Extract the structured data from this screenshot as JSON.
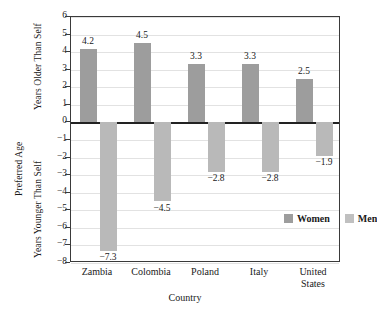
{
  "chart_data": {
    "type": "bar",
    "title": "",
    "xlabel": "Country",
    "ylabel": "Preferred Age",
    "ylabel_upper": "Years Older Than Self",
    "ylabel_lower": "Years Younger Than Self",
    "categories": [
      "Zambia",
      "Colombia",
      "Poland",
      "Italy",
      "United States"
    ],
    "category_lines": [
      [
        "Zambia"
      ],
      [
        "Colombia"
      ],
      [
        "Poland"
      ],
      [
        "Italy"
      ],
      [
        "United",
        "States"
      ]
    ],
    "series": [
      {
        "name": "Women",
        "color": "#9d9d9d",
        "values": [
          4.2,
          4.5,
          3.3,
          3.3,
          2.5
        ],
        "labels": [
          "4.2",
          "4.5",
          "3.3",
          "3.3",
          "2.5"
        ]
      },
      {
        "name": "Men",
        "color": "#b9b9b9",
        "values": [
          -7.3,
          -4.5,
          -2.8,
          -2.8,
          -1.9
        ],
        "labels": [
          "−7.3",
          "−4.5",
          "−2.8",
          "−2.8",
          "−1.9"
        ]
      }
    ],
    "ylim": [
      -8,
      6
    ],
    "yticks": [
      6,
      5,
      4,
      3,
      2,
      1,
      0,
      -1,
      -2,
      -3,
      -4,
      -5,
      -6,
      -7,
      -8
    ],
    "ytick_labels": [
      "6",
      "5",
      "4",
      "3",
      "2",
      "1",
      "0",
      "−1",
      "−2",
      "−3",
      "−4",
      "−5",
      "−6",
      "−7",
      "−8"
    ],
    "grid": true,
    "legend_position": "inside-lower-right"
  },
  "legend": {
    "entries": [
      {
        "label": "Women",
        "swatch": "#9d9d9d"
      },
      {
        "label": "Men",
        "swatch": "#c0c0c0"
      }
    ]
  }
}
